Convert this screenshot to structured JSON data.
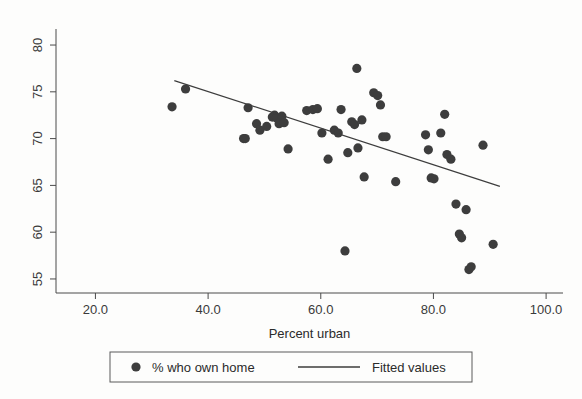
{
  "chart_data": {
    "type": "scatter",
    "title": "",
    "xlabel": "Percent urban",
    "ylabel": "",
    "xlim": [
      13.0,
      103.0
    ],
    "ylim": [
      53.5,
      81.5
    ],
    "xticks": [
      20.0,
      40.0,
      60.0,
      80.0,
      100.0
    ],
    "xtick_labels": [
      "20.0",
      "40.0",
      "60.0",
      "80.0",
      "100.0"
    ],
    "yticks": [
      55,
      60,
      65,
      70,
      75,
      80
    ],
    "ytick_labels": [
      "55",
      "60",
      "65",
      "70",
      "75",
      "80"
    ],
    "grid": false,
    "legend_position": "below",
    "series": [
      {
        "name": "% who own home",
        "type": "scatter",
        "marker": "circle",
        "color": "#3d3d3d",
        "points": [
          [
            33.6,
            73.4
          ],
          [
            36.0,
            75.3
          ],
          [
            46.3,
            70.0
          ],
          [
            46.6,
            70.0
          ],
          [
            47.1,
            73.3
          ],
          [
            48.6,
            71.6
          ],
          [
            49.2,
            70.9
          ],
          [
            50.4,
            71.3
          ],
          [
            51.4,
            72.3
          ],
          [
            51.8,
            72.5
          ],
          [
            52.2,
            72.2
          ],
          [
            52.6,
            71.6
          ],
          [
            53.1,
            72.4
          ],
          [
            53.5,
            71.7
          ],
          [
            54.2,
            68.9
          ],
          [
            57.5,
            73.0
          ],
          [
            58.6,
            73.1
          ],
          [
            59.4,
            73.2
          ],
          [
            60.2,
            70.6
          ],
          [
            61.3,
            67.8
          ],
          [
            62.4,
            70.9
          ],
          [
            63.1,
            70.6
          ],
          [
            63.6,
            73.1
          ],
          [
            64.3,
            58.0
          ],
          [
            64.8,
            68.5
          ],
          [
            65.5,
            71.8
          ],
          [
            66.0,
            71.5
          ],
          [
            66.4,
            77.5
          ],
          [
            66.6,
            69.0
          ],
          [
            67.3,
            72.0
          ],
          [
            67.7,
            65.9
          ],
          [
            69.4,
            74.9
          ],
          [
            70.1,
            74.6
          ],
          [
            70.6,
            73.6
          ],
          [
            71.0,
            70.2
          ],
          [
            71.6,
            70.2
          ],
          [
            73.3,
            65.4
          ],
          [
            78.6,
            70.4
          ],
          [
            79.1,
            68.8
          ],
          [
            79.6,
            65.8
          ],
          [
            80.1,
            65.7
          ],
          [
            81.3,
            70.6
          ],
          [
            82.0,
            72.6
          ],
          [
            82.4,
            68.3
          ],
          [
            83.1,
            67.8
          ],
          [
            84.0,
            63.0
          ],
          [
            84.6,
            59.8
          ],
          [
            85.0,
            59.4
          ],
          [
            85.8,
            62.4
          ],
          [
            86.3,
            56.0
          ],
          [
            86.7,
            56.3
          ],
          [
            88.8,
            69.3
          ],
          [
            90.6,
            58.7
          ]
        ]
      },
      {
        "name": "Fitted values",
        "type": "line",
        "color": "#3d3d3d",
        "endpoints": [
          [
            34.0,
            76.2
          ],
          [
            91.8,
            64.9
          ]
        ]
      }
    ]
  },
  "legend": {
    "items": [
      {
        "label": "% who own home",
        "glyph": "circle-marker"
      },
      {
        "label": "Fitted values",
        "glyph": "line-segment"
      }
    ]
  },
  "colors": {
    "marker": "#3d3d3d",
    "line": "#3d3d3d",
    "axis": "#4a4a4a",
    "background": "#fdfdfc"
  }
}
